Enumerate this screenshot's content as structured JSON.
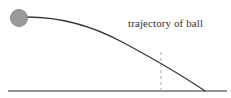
{
  "figure": {
    "name": "projectile-trajectory-diagram",
    "width": 231,
    "height": 98,
    "background_color": "#ffffff",
    "label": {
      "text": "trajectory of ball",
      "color": "#333333",
      "x": 128,
      "y": 18,
      "font_size_px": 11,
      "font_style": "serif"
    },
    "ball": {
      "name": "ball",
      "fill_color": "#9a9a9a",
      "stroke_color": "#8a8a8a",
      "center_x": 19,
      "center_y": 18,
      "radius": 8.5
    },
    "trajectory": {
      "name": "trajectory-curve",
      "stroke_color": "#3a3a3a",
      "stroke_width": 1.4,
      "start_x": 27,
      "start_y": 17,
      "end_x": 205,
      "end_y": 91,
      "path": "M27,17 C63,17 93,26 124,43 C152,58 180,74 205,91"
    },
    "ground": {
      "name": "ground-line",
      "stroke_color": "#6f6f6f",
      "stroke_width": 1.4,
      "x1": 8,
      "y1": 91,
      "x2": 227,
      "y2": 91
    },
    "drop_line": {
      "name": "vertical-dashed-drop-line",
      "stroke_color": "#aaaaaa",
      "stroke_width": 1,
      "dash_pattern": "3,3",
      "x": 161,
      "y_top": 52,
      "y_bottom": 91
    }
  },
  "chart_data": {
    "type": "line",
    "title": "",
    "xlabel": "",
    "ylabel": "",
    "annotations": [
      "trajectory of ball"
    ],
    "xlim": [
      0,
      231
    ],
    "ylim": [
      98,
      0
    ],
    "grid": false,
    "legend": "none",
    "series": [
      {
        "name": "trajectory of ball",
        "x": [
          27,
          45,
          63,
          81,
          99,
          117,
          135,
          153,
          171,
          189,
          205
        ],
        "y": [
          17,
          17,
          18,
          21,
          27,
          35,
          46,
          57,
          68,
          80,
          91
        ]
      },
      {
        "name": "ground",
        "x": [
          8,
          227
        ],
        "y": [
          91,
          91
        ]
      },
      {
        "name": "drop line",
        "x": [
          161,
          161
        ],
        "y": [
          52,
          91
        ]
      }
    ],
    "points": [
      {
        "name": "ball",
        "x": 19,
        "y": 18
      }
    ]
  }
}
